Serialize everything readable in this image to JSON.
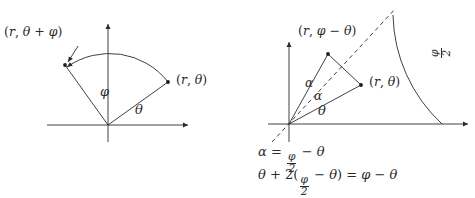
{
  "figure": {
    "background_color": "#ffffff",
    "stroke_color": "#2a2a2a",
    "panels": [
      {
        "id": "left-panel",
        "name": "rotation-by-phi-diagram",
        "origin": [
          108,
          125
        ],
        "axes": {
          "x_axis": {
            "from": [
              47,
              125
            ],
            "to": [
              190,
              125
            ],
            "arrow": "right"
          },
          "y_axis": {
            "from": [
              108,
              142
            ],
            "to": [
              108,
              22
            ],
            "arrow": "up"
          }
        },
        "radius": 74,
        "points": [
          {
            "name": "point-r-theta",
            "label": "(r, θ)",
            "angle_deg": 36,
            "dot": [
              168,
              81
            ]
          },
          {
            "name": "point-r-theta-plus-phi",
            "label": "(r, θ + φ)",
            "angle_deg": 126,
            "dot": [
              65,
              65
            ]
          }
        ],
        "arc": {
          "from_angle_deg": 36,
          "to_angle_deg": 126,
          "arrow_at": "end",
          "style": "solid"
        },
        "angle_labels": [
          {
            "name": "angle-label-phi",
            "label": "φ",
            "pos": [
              104,
              92
            ]
          },
          {
            "name": "angle-label-theta",
            "label": "θ",
            "pos": [
              138,
              110
            ]
          }
        ],
        "point_label_positions": [
          {
            "for": "point-r-theta",
            "pos": [
              176,
              75
            ]
          },
          {
            "for": "point-r-theta-plus-phi",
            "pos": [
              5,
              32
            ]
          }
        ],
        "pointer_arrow": {
          "from": [
            57,
            44
          ],
          "to": [
            64,
            63
          ]
        }
      },
      {
        "id": "right-panel",
        "name": "reflection-identity-diagram",
        "origin": [
          289,
          124
        ],
        "axes": {
          "x_axis": {
            "from": [
              268,
              124
            ],
            "to": [
              470,
              124
            ],
            "arrow": "right"
          },
          "y_axis": {
            "from": [
              289,
              142
            ],
            "to": [
              289,
              40
            ],
            "arrow": "up"
          }
        },
        "radius": 153,
        "bisector": {
          "name": "phi-over-2-bisector",
          "style": "dashed",
          "angle_deg": 47,
          "from": [
            272,
            143
          ],
          "to": [
            394,
            9
          ]
        },
        "arc": {
          "style": "solid",
          "from_angle_deg": 47,
          "to_angle_deg": 0,
          "meets_x_axis_at": [
            442,
            124
          ]
        },
        "points": [
          {
            "name": "point-r-theta",
            "label": "(r, θ)",
            "dot": [
              361,
              84
            ]
          },
          {
            "name": "point-r-phi-minus-theta",
            "label": "(r, φ − θ)",
            "dot": [
              328,
              53
            ]
          }
        ],
        "chord": {
          "name": "chord-between-points",
          "from": [
            328,
            53
          ],
          "to": [
            361,
            84
          ],
          "style": "solid"
        },
        "angle_labels": [
          {
            "name": "angle-label-alpha-upper",
            "label": "α",
            "pos": [
              309,
              84
            ]
          },
          {
            "name": "angle-label-alpha-lower",
            "label": "α",
            "pos": [
              317,
              96
            ]
          },
          {
            "name": "angle-label-theta",
            "label": "θ",
            "pos": [
              320,
              110
            ]
          }
        ],
        "point_label_positions": [
          {
            "for": "point-r-phi-minus-theta",
            "pos": [
              300,
              31
            ]
          },
          {
            "for": "point-r-theta",
            "pos": [
              369,
              78
            ]
          }
        ],
        "arc_label": {
          "name": "arc-label-phi-over-2",
          "numerator": "φ",
          "denominator": "2",
          "pos": [
            430,
            48
          ],
          "rotated": true
        },
        "equations": [
          {
            "name": "equation-alpha",
            "pos": [
              258,
              148
            ],
            "parts": [
              "α",
              "=",
              {
                "frac": [
                  "φ",
                  "2"
                ]
              },
              "−",
              "θ"
            ],
            "text": "α = φ/2 − θ"
          },
          {
            "name": "equation-theta-identity",
            "pos": [
              258,
              170
            ],
            "parts": [
              "θ",
              "+",
              "2(",
              {
                "frac": [
                  "φ",
                  "2"
                ]
              },
              "−",
              "θ",
              ")",
              "=",
              "φ",
              "−",
              "θ"
            ],
            "text": "θ + 2(φ/2 − θ) = φ − θ"
          }
        ]
      }
    ],
    "symbols": {
      "r": "r",
      "theta": "θ",
      "phi": "φ",
      "alpha": "α",
      "minus": "−",
      "plus": "+",
      "equals": "=",
      "two": "2",
      "open_paren": "(",
      "close_paren": ")",
      "comma": ","
    }
  }
}
